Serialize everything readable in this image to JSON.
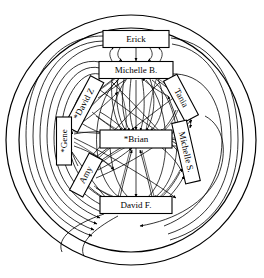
{
  "diagram": {
    "type": "social-network-sociogram",
    "title": "",
    "background_color": "#ffffff",
    "line_color": "#000000",
    "node_fill": "#ffffff",
    "boundary_circles": 2,
    "nodes": [
      {
        "id": "erick",
        "label": "Erick",
        "cx": 136,
        "cy": 39,
        "w": 66,
        "h": 17,
        "rotate": 0,
        "starred": false
      },
      {
        "id": "michelleb",
        "label": "Michelle B.",
        "cx": 136,
        "cy": 70,
        "w": 74,
        "h": 17,
        "rotate": 0,
        "starred": false
      },
      {
        "id": "davidz",
        "label": "*David Z",
        "cx": 84,
        "cy": 104,
        "w": 56,
        "h": 15,
        "rotate": -62,
        "starred": true
      },
      {
        "id": "tania",
        "label": "Tania",
        "cx": 181,
        "cy": 98,
        "w": 46,
        "h": 15,
        "rotate": 62,
        "starred": false
      },
      {
        "id": "gene",
        "label": "*Gene",
        "cx": 64,
        "cy": 141,
        "w": 48,
        "h": 15,
        "rotate": -90,
        "starred": true
      },
      {
        "id": "brian",
        "label": "*Brian",
        "cx": 136,
        "cy": 139,
        "w": 72,
        "h": 18,
        "rotate": 0,
        "starred": true
      },
      {
        "id": "michelles",
        "label": "Michelle S.",
        "cx": 186,
        "cy": 152,
        "w": 62,
        "h": 15,
        "rotate": 77,
        "starred": false
      },
      {
        "id": "amy",
        "label": "Amy",
        "cx": 86,
        "cy": 175,
        "w": 42,
        "h": 15,
        "rotate": -62,
        "starred": false
      },
      {
        "id": "davidf",
        "label": "David F.",
        "cx": 136,
        "cy": 205,
        "w": 72,
        "h": 17,
        "rotate": 0,
        "starred": false
      }
    ],
    "starred_nodes": [
      "*David Z",
      "*Gene",
      "*Brian"
    ],
    "node_count": 9,
    "edge_style": "directed-curved-with-arrowheads"
  }
}
